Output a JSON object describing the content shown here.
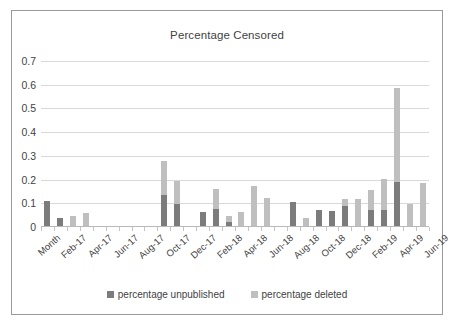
{
  "chart_data": {
    "type": "bar",
    "subtype": "stacked-column",
    "title": "Percentage Censored",
    "xlabel": "",
    "ylabel": "",
    "ylim": [
      0,
      0.7
    ],
    "yticks": [
      "0",
      "0.1",
      "0.2",
      "0.3",
      "0.4",
      "0.5",
      "0.6",
      "0.7"
    ],
    "ytick_values": [
      0,
      0.1,
      0.2,
      0.3,
      0.4,
      0.5,
      0.6,
      0.7
    ],
    "grid": true,
    "legend_position": "bottom",
    "categories": [
      "Month",
      "Feb-17",
      "Mar-17",
      "Apr-17",
      "May-17",
      "Jun-17",
      "Jul-17",
      "Aug-17",
      "Sep-17",
      "Oct-17",
      "Nov-17",
      "Dec-17",
      "Jan-18",
      "Feb-18",
      "Mar-18",
      "Apr-18",
      "May-18",
      "Jun-18",
      "Jul-18",
      "Aug-18",
      "Sep-18",
      "Oct-18",
      "Nov-18",
      "Dec-18",
      "Jan-19",
      "Feb-19",
      "Mar-19",
      "Apr-19",
      "May-19",
      "Jun-19"
    ],
    "tick_labels": [
      "Month",
      "Feb-17",
      "Apr-17",
      "Jun-17",
      "Aug-17",
      "Oct-17",
      "Dec-17",
      "Feb-18",
      "Apr-18",
      "Jun-18",
      "Aug-18",
      "Oct-18",
      "Dec-18",
      "Feb-19",
      "Apr-19",
      "Jun-19"
    ],
    "tick_label_indices": [
      0,
      2,
      4,
      6,
      8,
      10,
      12,
      14,
      16,
      18,
      20,
      22,
      24,
      26,
      28,
      30
    ],
    "series": [
      {
        "name": "percentage unpublished",
        "color": "#7c7c7c",
        "values": [
          0.11,
          0.04,
          0.0,
          0.0,
          0.0,
          0.0,
          0.0,
          0.0,
          0.0,
          0.135,
          0.095,
          0.0,
          0.065,
          0.077,
          0.02,
          0.0,
          0.0,
          0.0,
          0.0,
          0.105,
          0.0,
          0.073,
          0.067,
          0.088,
          0.0,
          0.07,
          0.073,
          0.188,
          0.0,
          0.0
        ]
      },
      {
        "name": "percentage deleted",
        "color": "#bfbfbf",
        "values": [
          0.0,
          0.0,
          0.048,
          0.057,
          0.0,
          0.0,
          0.0,
          0.0,
          0.0,
          0.145,
          0.1,
          0.0,
          0.0,
          0.082,
          0.026,
          0.062,
          0.172,
          0.123,
          0.0,
          0.0,
          0.037,
          0.0,
          0.0,
          0.032,
          0.12,
          0.085,
          0.13,
          0.4,
          0.095,
          0.185
        ]
      }
    ]
  },
  "legend": {
    "items": [
      {
        "label": "percentage unpublished",
        "color": "#7c7c7c"
      },
      {
        "label": "percentage deleted",
        "color": "#bfbfbf"
      }
    ]
  }
}
